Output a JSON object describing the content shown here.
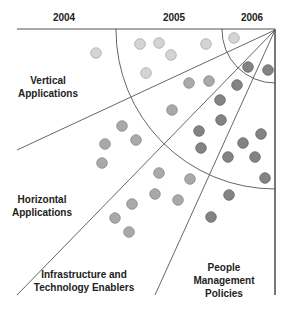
{
  "years": [
    {
      "label": "2004",
      "x": 64
    },
    {
      "label": "2005",
      "x": 174
    },
    {
      "label": "2006",
      "x": 252
    }
  ],
  "segments": [
    {
      "id": "vertical",
      "label": "Vertical\nApplications",
      "x": 48,
      "y": 74
    },
    {
      "id": "horizontal",
      "label": "Horizontal\nApplications",
      "x": 42,
      "y": 193
    },
    {
      "id": "infrastructure",
      "label": "Infrastructure and\nTechnology Enablers",
      "x": 84,
      "y": 268
    },
    {
      "id": "people",
      "label": "People\nManagement\nPolicies",
      "x": 224,
      "y": 261
    }
  ],
  "geometry": {
    "apex": [
      275,
      30
    ],
    "top_line": [
      [
        17,
        29
      ],
      [
        275,
        29
      ]
    ],
    "right_line": [
      [
        275,
        29
      ],
      [
        275,
        295
      ]
    ],
    "rays": [
      [
        17,
        150
      ],
      [
        17,
        295
      ],
      [
        155,
        295
      ]
    ],
    "arcs": [
      {
        "name": "2004-2005-boundary",
        "radius": 159
      },
      {
        "name": "2005-2006-boundary",
        "radius": 53
      }
    ]
  },
  "colors": {
    "line": "#555555",
    "light": "#d4d4d4",
    "light_stroke": "#a8a8a8",
    "medium": "#a9a9a9",
    "medium_stroke": "#888888",
    "dark": "#838383",
    "dark_stroke": "#666666"
  },
  "dots": [
    {
      "x": 96,
      "y": 53,
      "tone": "light"
    },
    {
      "x": 140,
      "y": 44,
      "tone": "light"
    },
    {
      "x": 159,
      "y": 43,
      "tone": "light"
    },
    {
      "x": 171,
      "y": 55,
      "tone": "light"
    },
    {
      "x": 146,
      "y": 73,
      "tone": "light"
    },
    {
      "x": 206,
      "y": 44,
      "tone": "light"
    },
    {
      "x": 234,
      "y": 38,
      "tone": "light"
    },
    {
      "x": 189,
      "y": 83,
      "tone": "medium"
    },
    {
      "x": 209,
      "y": 81,
      "tone": "medium"
    },
    {
      "x": 172,
      "y": 110,
      "tone": "medium"
    },
    {
      "x": 122,
      "y": 126,
      "tone": "medium"
    },
    {
      "x": 136,
      "y": 140,
      "tone": "medium"
    },
    {
      "x": 105,
      "y": 144,
      "tone": "medium"
    },
    {
      "x": 102,
      "y": 163,
      "tone": "medium"
    },
    {
      "x": 248,
      "y": 67,
      "tone": "dark"
    },
    {
      "x": 268,
      "y": 70,
      "tone": "dark"
    },
    {
      "x": 237,
      "y": 85,
      "tone": "dark"
    },
    {
      "x": 220,
      "y": 100,
      "tone": "dark"
    },
    {
      "x": 221,
      "y": 120,
      "tone": "dark"
    },
    {
      "x": 199,
      "y": 131,
      "tone": "dark"
    },
    {
      "x": 201,
      "y": 148,
      "tone": "dark"
    },
    {
      "x": 261,
      "y": 134,
      "tone": "dark"
    },
    {
      "x": 243,
      "y": 143,
      "tone": "dark"
    },
    {
      "x": 228,
      "y": 157,
      "tone": "dark"
    },
    {
      "x": 255,
      "y": 157,
      "tone": "dark"
    },
    {
      "x": 265,
      "y": 178,
      "tone": "dark"
    },
    {
      "x": 229,
      "y": 195,
      "tone": "dark"
    },
    {
      "x": 211,
      "y": 217,
      "tone": "dark"
    },
    {
      "x": 159,
      "y": 173,
      "tone": "medium"
    },
    {
      "x": 190,
      "y": 179,
      "tone": "medium"
    },
    {
      "x": 155,
      "y": 194,
      "tone": "medium"
    },
    {
      "x": 178,
      "y": 200,
      "tone": "medium"
    },
    {
      "x": 132,
      "y": 204,
      "tone": "medium"
    },
    {
      "x": 115,
      "y": 218,
      "tone": "medium"
    },
    {
      "x": 129,
      "y": 232,
      "tone": "medium"
    }
  ]
}
